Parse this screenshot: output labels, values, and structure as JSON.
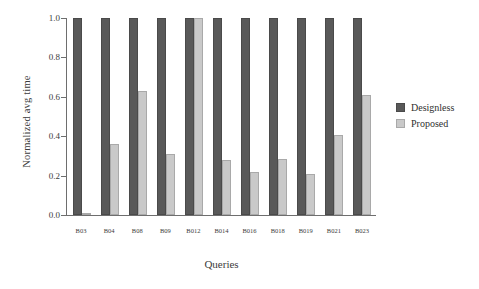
{
  "chart_data": {
    "type": "bar",
    "title": "",
    "xlabel": "Queries",
    "ylabel": "Normalized avg time",
    "categories": [
      "B03",
      "B04",
      "B08",
      "B09",
      "B012",
      "B014",
      "B016",
      "B018",
      "B019",
      "B021",
      "B023"
    ],
    "series": [
      {
        "name": "Designless",
        "color": "#595959",
        "values": [
          1.0,
          1.0,
          1.0,
          1.0,
          1.0,
          1.0,
          1.0,
          1.0,
          1.0,
          1.0,
          1.0
        ]
      },
      {
        "name": "Proposed",
        "color": "#c9c9c9",
        "values": [
          0.01,
          0.36,
          0.63,
          0.31,
          1.0,
          0.28,
          0.22,
          0.285,
          0.21,
          0.405,
          0.61
        ]
      }
    ],
    "ylim": [
      0.0,
      1.0
    ],
    "yticks": [
      "0.0",
      "0.2",
      "0.4",
      "0.6",
      "0.8",
      "1.0"
    ],
    "ytick_values": [
      0.0,
      0.2,
      0.4,
      0.6,
      0.8,
      1.0
    ],
    "grid": false,
    "legend_position": "right"
  },
  "legend": {
    "entries": [
      {
        "label": "Designless",
        "color": "#595959"
      },
      {
        "label": "Proposed",
        "color": "#c9c9c9"
      }
    ]
  }
}
